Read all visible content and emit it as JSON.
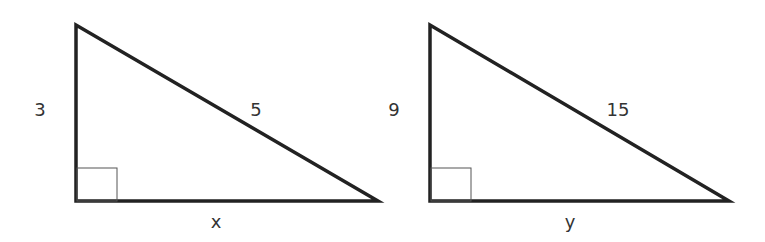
{
  "diagram": {
    "stroke_color": "#222222",
    "triangles": [
      {
        "name": "triangle-1",
        "vertical_leg": "3",
        "hypotenuse": "5",
        "horizontal_leg": "x",
        "right_angle": true
      },
      {
        "name": "triangle-2",
        "vertical_leg": "9",
        "hypotenuse": "15",
        "horizontal_leg": "y",
        "right_angle": true
      }
    ]
  }
}
